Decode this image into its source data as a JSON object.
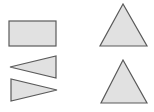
{
  "colors": {
    "background": "#ffffff",
    "fill": "#e1e1e1",
    "stroke": "#5a5a5a"
  },
  "shapes": [
    {
      "name": "rectangle",
      "type": "rect",
      "x": 9,
      "y": 21,
      "width": 47,
      "height": 25
    },
    {
      "name": "left-pointing-triangle",
      "type": "polygon",
      "points": "10,67 56,56 56,78"
    },
    {
      "name": "right-pointing-triangle",
      "type": "polygon",
      "points": "11,79 11,101 57,90"
    },
    {
      "name": "upright-triangle-top",
      "type": "polygon",
      "points": "123,4 100,46 147,46"
    },
    {
      "name": "upright-triangle-bottom",
      "type": "polygon",
      "points": "123,60 101,103 147,103"
    }
  ]
}
